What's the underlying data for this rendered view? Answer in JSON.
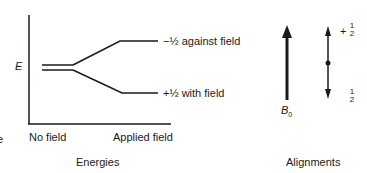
{
  "energies": {
    "axis_label": "E",
    "x_labels": {
      "left": "No field",
      "right": "Applied field"
    },
    "upper_level": "−½ against field",
    "lower_level": "+½ with field",
    "caption": "Energies",
    "edge_fragment": "e"
  },
  "alignments": {
    "field_label": "B",
    "field_subscript": "0",
    "up_sign": "+",
    "up_frac_num": "1",
    "up_frac_den": "2",
    "down_frac_num": "1",
    "down_frac_den": "2",
    "caption": "Alignments"
  },
  "colors": {
    "ink": "#1a1a1a",
    "background": "#ffffff"
  }
}
